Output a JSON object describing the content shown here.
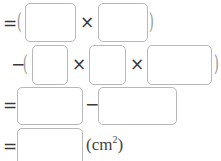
{
  "rows": [
    {
      "lead": "=",
      "open": "(",
      "ops": [
        "×"
      ],
      "close": ")"
    },
    {
      "lead": "−",
      "open": "(",
      "ops": [
        "×",
        "×"
      ],
      "close": ")"
    },
    {
      "lead": "=",
      "ops": [
        "−"
      ]
    },
    {
      "lead": "=",
      "unit_base": "(cm",
      "unit_exp": "2",
      "unit_close": ")"
    }
  ],
  "boxes": [
    "",
    "",
    "",
    "",
    "",
    "",
    "",
    ""
  ]
}
